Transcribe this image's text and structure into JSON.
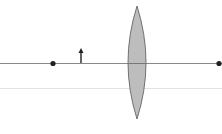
{
  "diagram": {
    "type": "thin-lens-ray-diagram",
    "width": 222,
    "height": 134,
    "colors": {
      "background": "#ffffff",
      "axis": "#8a8a8a",
      "secondary_line": "#e2e2e2",
      "lens_fill": "#bdbdbd",
      "lens_stroke": "#555555",
      "point": "#222222",
      "object_arrow": "#222222"
    },
    "optical_axis": {
      "y": 63,
      "x1": 0,
      "x2": 222
    },
    "secondary_line": {
      "y": 88,
      "x1": 0,
      "x2": 222
    },
    "lens": {
      "type": "converging",
      "cx": 137,
      "top": 6,
      "bottom": 119,
      "half_width": 9
    },
    "focal_points": [
      {
        "name": "left-focal-point",
        "x": 53,
        "y": 63
      },
      {
        "name": "right-focal-point",
        "x": 219,
        "y": 63
      }
    ],
    "object": {
      "x": 81,
      "base_y": 63,
      "tip_y": 48
    }
  }
}
